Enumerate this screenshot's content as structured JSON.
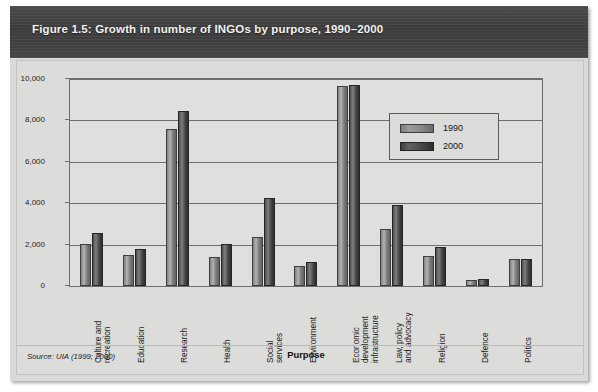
{
  "figure": {
    "title": "Figure 1.5: Growth in number of INGOs by purpose, 1990–2000",
    "source": "Source: UIA (1999; 2000)"
  },
  "legend": {
    "position": "inside-top-right",
    "entries": [
      {
        "label": "1990",
        "color": "#8a8a8a"
      },
      {
        "label": "2000",
        "color": "#4a4a4a"
      }
    ]
  },
  "axis": {
    "y_ticks": [
      "0",
      "2,000",
      "4,000",
      "6,000",
      "8,000",
      "10,000"
    ],
    "x_title": "Purpose"
  },
  "chart_data": {
    "type": "bar",
    "title": "Figure 1.5: Growth in number of INGOs by purpose, 1990–2000",
    "xlabel": "Purpose",
    "ylabel": "",
    "ylim": [
      0,
      10000
    ],
    "ytick_values": [
      0,
      2000,
      4000,
      6000,
      8000,
      10000
    ],
    "grid": true,
    "legend_position": "inside-top-right",
    "categories": [
      "Culture and recreation",
      "Education",
      "Research",
      "Health",
      "Social services",
      "Environment",
      "Economic development infrastructure",
      "Law, policy and advocacy",
      "Religion",
      "Defence",
      "Politics"
    ],
    "series": [
      {
        "name": "1990",
        "color": "#8a8a8a",
        "values": [
          2050,
          1500,
          7600,
          1400,
          2350,
          950,
          9650,
          2750,
          1450,
          300,
          1300
        ]
      },
      {
        "name": "2000",
        "color": "#4a4a4a",
        "values": [
          2550,
          1800,
          8450,
          2050,
          4250,
          1150,
          9700,
          3900,
          1900,
          320,
          1300
        ]
      }
    ]
  }
}
